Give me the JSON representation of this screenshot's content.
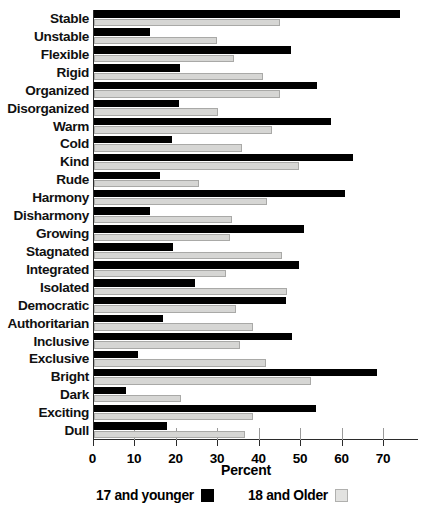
{
  "chart_data": {
    "type": "bar",
    "orientation": "horizontal",
    "title": "",
    "xlabel": "Percent",
    "ylabel": "",
    "xlim": [
      0,
      78
    ],
    "xticks": [
      0,
      10,
      20,
      30,
      40,
      50,
      60,
      70
    ],
    "grid": false,
    "legend_position": "bottom",
    "categories": [
      "Stable",
      "Unstable",
      "Flexible",
      "Rigid",
      "Organized",
      "Disorganized",
      "Warm",
      "Cold",
      "Kind",
      "Rude",
      "Harmony",
      "Disharmony",
      "Growing",
      "Stagnated",
      "Integrated",
      "Isolated",
      "Democratic",
      "Authoritarian",
      "Inclusive",
      "Exclusive",
      "Bright",
      "Dark",
      "Exciting",
      "Dull"
    ],
    "series": [
      {
        "name": "17 and younger",
        "color": "#000000",
        "values": [
          73.7,
          13.5,
          47.4,
          20.7,
          53.7,
          20.5,
          57.0,
          18.7,
          62.5,
          15.8,
          60.5,
          13.5,
          50.5,
          19.0,
          49.5,
          24.3,
          46.3,
          16.7,
          47.6,
          10.7,
          68.1,
          7.7,
          53.5,
          17.5
        ]
      },
      {
        "name": "18 and Older",
        "color": "#d6d6d4",
        "values": [
          44.7,
          29.7,
          33.8,
          40.7,
          44.7,
          29.8,
          42.8,
          35.6,
          49.4,
          25.3,
          41.6,
          33.3,
          32.8,
          45.2,
          31.8,
          46.6,
          34.2,
          38.2,
          35.2,
          41.4,
          52.2,
          21.0,
          38.4,
          36.4
        ]
      }
    ]
  },
  "legend": {
    "items": [
      {
        "label": "17 and younger",
        "swatch": "black-square"
      },
      {
        "label": "18 and Older",
        "swatch": "light-gray-square"
      }
    ]
  },
  "axis": {
    "x_title": "Percent",
    "tick_labels": [
      "0",
      "10",
      "20",
      "30",
      "40",
      "50",
      "60",
      "70"
    ]
  }
}
